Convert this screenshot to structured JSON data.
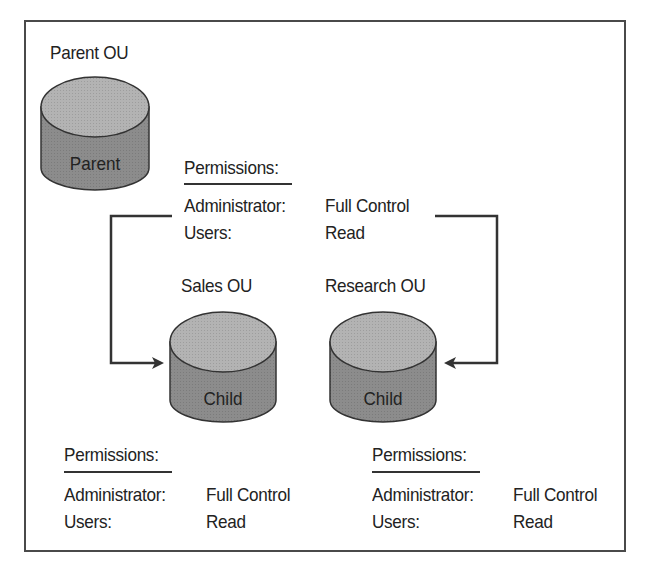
{
  "diagram": {
    "parent": {
      "title": "Parent OU",
      "cylinder_label": "Parent"
    },
    "inherited_permissions": {
      "heading": "Permissions:",
      "rows": [
        {
          "principal": "Administrator:",
          "right": "Full Control"
        },
        {
          "principal": "Users:",
          "right": "Read"
        }
      ]
    },
    "children": [
      {
        "title": "Sales OU",
        "cylinder_label": "Child",
        "permissions": {
          "heading": "Permissions:",
          "rows": [
            {
              "principal": "Administrator:",
              "right": "Full Control"
            },
            {
              "principal": "Users:",
              "right": "Read"
            }
          ]
        }
      },
      {
        "title": "Research OU",
        "cylinder_label": "Child",
        "permissions": {
          "heading": "Permissions:",
          "rows": [
            {
              "principal": "Administrator:",
              "right": "Full Control"
            },
            {
              "principal": "Users:",
              "right": "Read"
            }
          ]
        }
      }
    ],
    "colors": {
      "cylinder_top": "#b3b3b3",
      "cylinder_side": "#8c8c8c",
      "line": "#333333",
      "border": "#4a4a4a"
    }
  }
}
